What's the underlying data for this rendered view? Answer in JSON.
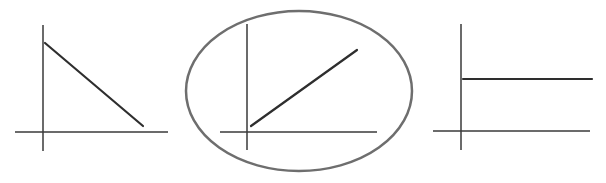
{
  "diagram": {
    "colors": {
      "background": "#ffffff",
      "axis": "#3a3a3a",
      "line": "#2e2e2e",
      "circle": "#6e6e6e"
    },
    "graphs": [
      {
        "id": "graph-1",
        "trend": "decreasing",
        "circled": false,
        "axes": {
          "vertical": {
            "x": 43,
            "y1": 25,
            "y2": 151
          },
          "horizontal": {
            "y": 132,
            "x1": 15,
            "x2": 168
          }
        },
        "line": {
          "x1": 45,
          "y1": 43,
          "x2": 143,
          "y2": 126
        }
      },
      {
        "id": "graph-2",
        "trend": "increasing",
        "circled": true,
        "axes": {
          "vertical": {
            "x": 247,
            "y1": 24,
            "y2": 150
          },
          "horizontal": {
            "y": 132,
            "x1": 220,
            "x2": 377
          }
        },
        "line": {
          "x1": 251,
          "y1": 126,
          "x2": 357,
          "y2": 50
        },
        "circle": {
          "cx": 299,
          "cy": 91,
          "rx": 113,
          "ry": 80
        }
      },
      {
        "id": "graph-3",
        "trend": "constant",
        "circled": false,
        "axes": {
          "vertical": {
            "x": 461,
            "y1": 24,
            "y2": 150
          },
          "horizontal": {
            "y": 131,
            "x1": 433,
            "x2": 590
          }
        },
        "line": {
          "x1": 463,
          "y1": 79,
          "x2": 592,
          "y2": 79
        }
      }
    ]
  }
}
